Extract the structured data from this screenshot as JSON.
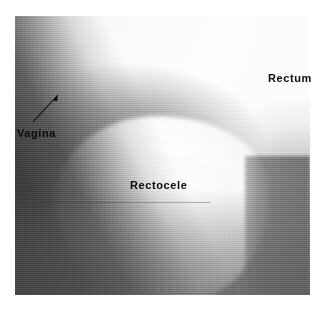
{
  "figure": {
    "modality": "radiograph",
    "study": "defecography",
    "plate_background": "#c9c9c9",
    "annotation_color": "#0b0b0b",
    "page_background": "#ffffff"
  },
  "annotations": [
    {
      "id": "rectum",
      "label": "Rectum",
      "x": 268,
      "y": 73,
      "has_leader": false
    },
    {
      "id": "vagina",
      "label": "Vagina",
      "x": 17,
      "y": 128,
      "has_leader": true,
      "leader": {
        "icon": "arrow-icon",
        "tail_x": 33,
        "tail_y": 122,
        "head_x": 58,
        "head_y": 95
      }
    },
    {
      "id": "rectocele",
      "label": "Rectocele",
      "x": 130,
      "y": 180,
      "has_leader": false
    }
  ]
}
